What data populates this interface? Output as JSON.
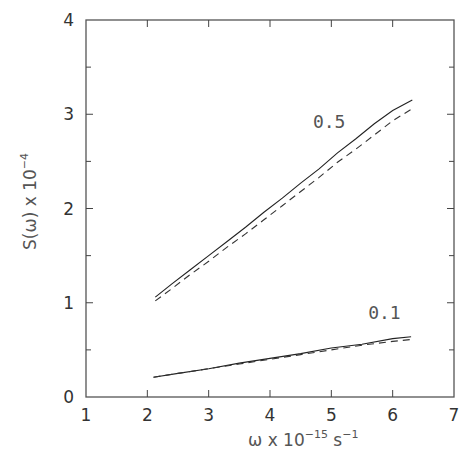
{
  "chart_data": {
    "type": "line",
    "title": "",
    "xlabel": {
      "base": "ω  x  10",
      "sup1": "−15",
      "mid": "  s",
      "sup2": "−1"
    },
    "ylabel": {
      "base": "S(ω)  x  10",
      "sup": "−4"
    },
    "xlim": [
      1,
      7
    ],
    "ylim": [
      0,
      4
    ],
    "xticks": [
      1,
      2,
      3,
      4,
      5,
      6,
      7
    ],
    "xtick_labels": [
      "1",
      "2",
      "3",
      "4",
      "5",
      "6",
      "7"
    ],
    "yticks": [
      0,
      1,
      2,
      3,
      4
    ],
    "ytick_labels": [
      "0",
      "1",
      "2",
      "3",
      "4"
    ],
    "y_minor_ticks": [
      0.5,
      1.5,
      2.5,
      3.5
    ],
    "grid": false,
    "legend": "none",
    "series": [
      {
        "name": "0.5 (solid)",
        "style": "solid",
        "x": [
          2.13,
          2.4,
          2.7,
          3.0,
          3.3,
          3.6,
          3.9,
          4.2,
          4.5,
          4.8,
          5.1,
          5.4,
          5.7,
          6.0,
          6.32
        ],
        "y": [
          1.06,
          1.2,
          1.35,
          1.5,
          1.65,
          1.8,
          1.96,
          2.11,
          2.27,
          2.42,
          2.59,
          2.74,
          2.9,
          3.04,
          3.15
        ]
      },
      {
        "name": "0.5 (dashed)",
        "style": "dashed",
        "x": [
          2.13,
          2.4,
          2.7,
          3.0,
          3.3,
          3.6,
          3.9,
          4.2,
          4.5,
          4.8,
          5.1,
          5.4,
          5.7,
          6.0,
          6.32
        ],
        "y": [
          1.02,
          1.15,
          1.3,
          1.44,
          1.59,
          1.73,
          1.88,
          2.03,
          2.18,
          2.33,
          2.49,
          2.63,
          2.78,
          2.93,
          3.06
        ]
      },
      {
        "name": "0.1 (solid)",
        "style": "solid",
        "x": [
          2.1,
          2.5,
          3.0,
          3.5,
          4.0,
          4.5,
          5.0,
          5.5,
          6.0,
          6.3
        ],
        "y": [
          0.21,
          0.25,
          0.3,
          0.36,
          0.41,
          0.46,
          0.52,
          0.56,
          0.62,
          0.64
        ]
      },
      {
        "name": "0.1 (dashed)",
        "style": "dashed",
        "x": [
          2.1,
          2.5,
          3.0,
          3.5,
          4.0,
          4.5,
          5.0,
          5.5,
          6.0,
          6.3
        ],
        "y": [
          0.21,
          0.25,
          0.3,
          0.35,
          0.4,
          0.45,
          0.5,
          0.55,
          0.59,
          0.61
        ]
      }
    ],
    "annotations": [
      {
        "text": "0.5",
        "x": 4.7,
        "y": 2.85
      },
      {
        "text": "0.1",
        "x": 5.6,
        "y": 0.83
      }
    ]
  }
}
